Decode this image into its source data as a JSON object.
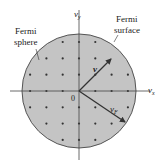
{
  "diagram": {
    "labels": {
      "fermi_sphere": [
        "Fermi",
        "sphere"
      ],
      "fermi_surface": [
        "Fermi",
        "surface"
      ],
      "axis_x": "v",
      "axis_x_sub": "x",
      "axis_y": "v",
      "axis_y_sub": "y",
      "origin": "0",
      "vector_v": "v",
      "vector_vf": "v",
      "vector_vf_sub": "F"
    },
    "colors": {
      "sphere_fill": "#c4c4c4",
      "sphere_stroke": "#555555",
      "axis": "#444444",
      "dot": "#333333",
      "arrow": "#333333",
      "text": "#222222"
    },
    "geometry": {
      "center": [
        79,
        91
      ],
      "radius": 57,
      "grid_spacing": 16.3
    }
  }
}
